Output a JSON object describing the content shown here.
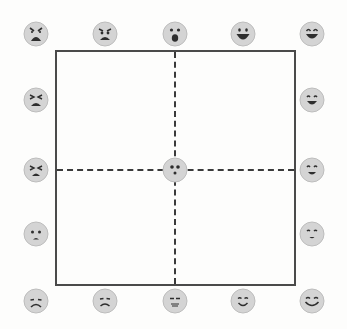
{
  "diagram": {
    "colors": {
      "frame": "#4a4a4a",
      "dashed_axes": "#3a3a3a",
      "face_fill": "#d4d4d4",
      "face_stroke": "#bdbdbd",
      "feature": "#2e2e2e",
      "background": "#fdfdfc"
    },
    "frame": {
      "left": 55,
      "top": 50,
      "right": 294,
      "bottom": 284
    },
    "axes": {
      "vertical_x": 175,
      "horizontal_y": 170
    },
    "faces": [
      {
        "id": "top-1",
        "position": "top-left corner",
        "expression": "furious",
        "x": 36,
        "y": 34
      },
      {
        "id": "top-2",
        "position": "top",
        "expression": "angry",
        "x": 105,
        "y": 34
      },
      {
        "id": "top-3",
        "position": "top center",
        "expression": "surprised",
        "x": 175,
        "y": 34
      },
      {
        "id": "top-4",
        "position": "top",
        "expression": "happy-open-mouth",
        "x": 243,
        "y": 34
      },
      {
        "id": "top-5",
        "position": "top-right corner",
        "expression": "laughing",
        "x": 312,
        "y": 34
      },
      {
        "id": "left-1",
        "position": "left upper",
        "expression": "frustrated",
        "x": 36,
        "y": 100
      },
      {
        "id": "left-2",
        "position": "left center",
        "expression": "stressed-squint",
        "x": 36,
        "y": 170
      },
      {
        "id": "left-3",
        "position": "left lower",
        "expression": "upset",
        "x": 36,
        "y": 234
      },
      {
        "id": "right-1",
        "position": "right upper",
        "expression": "joyful",
        "x": 312,
        "y": 100
      },
      {
        "id": "right-2",
        "position": "right center",
        "expression": "pleased",
        "x": 312,
        "y": 170
      },
      {
        "id": "right-3",
        "position": "right lower",
        "expression": "content",
        "x": 312,
        "y": 234
      },
      {
        "id": "center",
        "position": "center",
        "expression": "neutral-dots",
        "x": 175,
        "y": 170
      },
      {
        "id": "bottom-1",
        "position": "bottom-left corner",
        "expression": "sad",
        "x": 36,
        "y": 301
      },
      {
        "id": "bottom-2",
        "position": "bottom",
        "expression": "glum",
        "x": 105,
        "y": 301
      },
      {
        "id": "bottom-3",
        "position": "bottom center",
        "expression": "sleepy-neutral",
        "x": 175,
        "y": 301
      },
      {
        "id": "bottom-4",
        "position": "bottom",
        "expression": "calm",
        "x": 243,
        "y": 301
      },
      {
        "id": "bottom-5",
        "position": "bottom-right corner",
        "expression": "relaxed",
        "x": 312,
        "y": 301
      }
    ]
  }
}
